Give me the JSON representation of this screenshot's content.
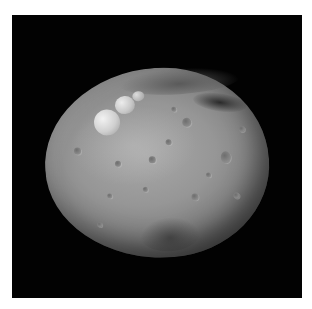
{
  "image": {
    "subject": "asteroid",
    "description": "Grayscale photograph of a heavily cratered, roughly spherical asteroid against a black background",
    "colors": {
      "page_background": "#ffffff",
      "space_background": "#020202",
      "surface_mid": "#969696",
      "surface_highlight": "#e6e6e6",
      "surface_shadow": "#3a3a3a"
    },
    "features": [
      {
        "name": "snowman-craters",
        "description": "Three bright adjoining craters in upper-left"
      },
      {
        "name": "dark-band",
        "description": "Dark shadowed region in upper-right"
      },
      {
        "name": "south-basin",
        "description": "Darker textured region near the bottom"
      }
    ]
  }
}
